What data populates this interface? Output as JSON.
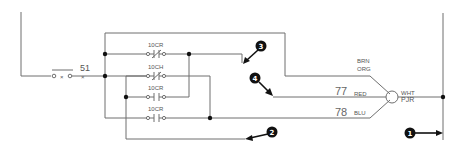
{
  "diagram": {
    "type": "ladder-wiring-schematic",
    "colors": {
      "wire": "#6f6f6f",
      "junction": "#111111",
      "callout": "#111111"
    },
    "switch": {
      "label": "51",
      "symbol": "o x o",
      "sublabel": "×"
    },
    "contacts": [
      {
        "label": "10CR",
        "type": "normally-closed"
      },
      {
        "label": "10CH",
        "type": "normally-closed"
      },
      {
        "label": "10CR",
        "type": "normally-open"
      },
      {
        "label": "10CR",
        "type": "normally-open"
      }
    ],
    "connector": {
      "wires_in": [
        {
          "color_label_top": "BRN",
          "color_label_bottom": "ORG"
        },
        {
          "wire_number": "77",
          "color_label": "RED"
        },
        {
          "wire_number": "78",
          "color_label": "BLU"
        }
      ],
      "wire_out": {
        "label_top": "WHT",
        "label_bottom": "PJR"
      }
    },
    "callouts": [
      {
        "number": "1"
      },
      {
        "number": "2"
      },
      {
        "number": "3"
      },
      {
        "number": "4"
      }
    ]
  }
}
